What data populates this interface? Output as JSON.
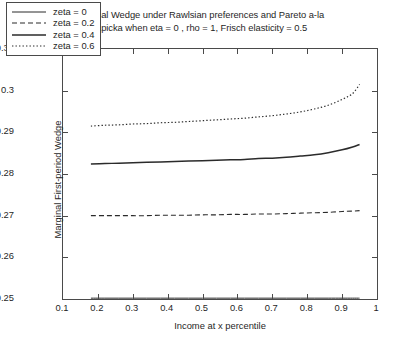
{
  "chart_data": {
    "type": "line",
    "title": "Marginal Wedge under Rawlsian preferences and Pareto a-la Kapicka when eta = 0 , rho = 1, Frisch elasticity = 0.5",
    "title_lines": [
      "Marginal Wedge under Rawlsian preferences and Pareto a-la",
      "Kapicka when eta = 0 , rho = 1, Frisch elasticity = 0.5"
    ],
    "xlabel": "Income at x percentile",
    "ylabel": "Marginal First-period Wedge",
    "xlim": [
      0.1,
      1.0
    ],
    "ylim": [
      0.25,
      0.31
    ],
    "xticks": [
      0.1,
      0.2,
      0.3,
      0.4,
      0.5,
      0.6,
      0.7,
      0.8,
      0.9,
      1
    ],
    "xticklabels": [
      "0.1",
      "0.2",
      "0.3",
      "0.4",
      "0.5",
      "0.6",
      "0.7",
      "0.8",
      "0.9",
      "1"
    ],
    "yticks": [
      0.25,
      0.26,
      0.27,
      0.28,
      0.29,
      0.3,
      0.31
    ],
    "yticklabels": [
      "0.25",
      "0.26",
      "0.27",
      "0.28",
      "0.29",
      "0.3",
      "0.31"
    ],
    "grid": false,
    "legend_position": "upper left",
    "x": [
      0.18,
      0.22,
      0.26,
      0.3,
      0.34,
      0.38,
      0.42,
      0.46,
      0.5,
      0.54,
      0.58,
      0.62,
      0.66,
      0.7,
      0.74,
      0.78,
      0.82,
      0.86,
      0.9,
      0.93,
      0.95
    ],
    "series": [
      {
        "name": "zeta = 0",
        "linestyle": "solid-thin",
        "values": [
          0.2502,
          0.2502,
          0.2502,
          0.2502,
          0.2502,
          0.2502,
          0.2502,
          0.2502,
          0.2502,
          0.2502,
          0.2502,
          0.2502,
          0.2502,
          0.2502,
          0.2502,
          0.2502,
          0.2502,
          0.2502,
          0.2502,
          0.2502,
          0.2502
        ]
      },
      {
        "name": "zeta = 0.2",
        "linestyle": "dashed",
        "values": [
          0.27,
          0.27,
          0.27,
          0.27,
          0.27,
          0.2701,
          0.2701,
          0.2701,
          0.2702,
          0.2702,
          0.2703,
          0.2703,
          0.2704,
          0.2704,
          0.2705,
          0.2706,
          0.2707,
          0.2708,
          0.271,
          0.2711,
          0.2712
        ]
      },
      {
        "name": "zeta = 0.4",
        "linestyle": "solid-thick",
        "values": [
          0.2824,
          0.2825,
          0.2826,
          0.2827,
          0.2828,
          0.2829,
          0.283,
          0.2831,
          0.2832,
          0.2833,
          0.2834,
          0.2835,
          0.2837,
          0.2838,
          0.284,
          0.2843,
          0.2846,
          0.2851,
          0.2858,
          0.2865,
          0.2871
        ]
      },
      {
        "name": "zeta = 0.6",
        "linestyle": "dotted",
        "values": [
          0.2915,
          0.2917,
          0.2918,
          0.292,
          0.2921,
          0.2923,
          0.2924,
          0.2926,
          0.2928,
          0.293,
          0.2932,
          0.2934,
          0.2937,
          0.294,
          0.2944,
          0.2949,
          0.2956,
          0.2965,
          0.2979,
          0.2993,
          0.3015
        ]
      }
    ]
  }
}
